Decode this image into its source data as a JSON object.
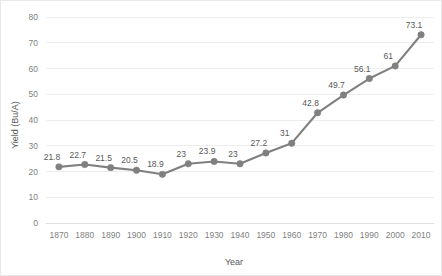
{
  "chart_data": {
    "type": "line",
    "title": "",
    "xlabel": "Year",
    "ylabel": "Yield (Bu/A)",
    "categories": [
      1870,
      1880,
      1890,
      1900,
      1910,
      1920,
      1930,
      1940,
      1950,
      1960,
      1970,
      1980,
      1990,
      2000,
      2010
    ],
    "x_tick_labels": [
      "1870",
      "1880",
      "1890",
      "1900",
      "1910",
      "1920",
      "1930",
      "1940",
      "1950",
      "1960",
      "1970",
      "1980",
      "1990",
      "2000",
      "2010"
    ],
    "values": [
      21.8,
      22.7,
      21.5,
      20.5,
      18.9,
      23,
      23.9,
      23,
      27.2,
      31,
      42.8,
      49.7,
      56.1,
      61,
      73.1
    ],
    "data_labels": [
      "21.8",
      "22.7",
      "21.5",
      "20.5",
      "18.9",
      "23",
      "23.9",
      "23",
      "27.2",
      "31",
      "42.8",
      "49.7",
      "56.1",
      "61",
      "73.1"
    ],
    "ylim": [
      0,
      80
    ],
    "y_ticks": [
      0,
      10,
      20,
      30,
      40,
      50,
      60,
      70,
      80
    ],
    "y_tick_labels": [
      "0",
      "10",
      "20",
      "30",
      "40",
      "50",
      "60",
      "70",
      "80"
    ],
    "grid": "horizontal",
    "legend": "none",
    "series_color": "#808080",
    "gridline_color": "#ededed",
    "label_color": "#595959",
    "tick_color": "#7f7f7f",
    "show_data_labels": true,
    "marker": "circle"
  }
}
